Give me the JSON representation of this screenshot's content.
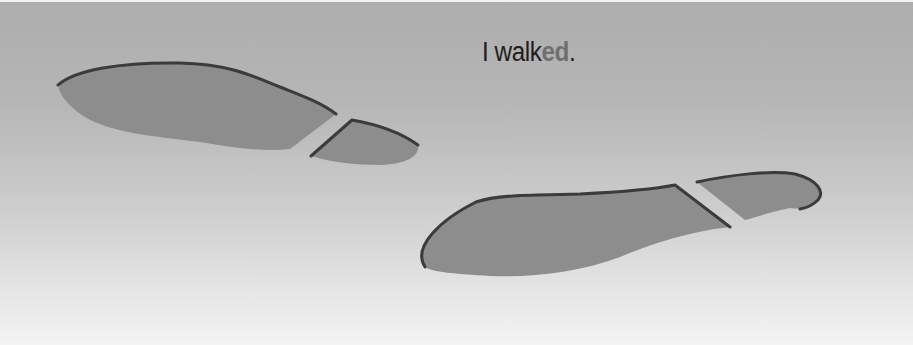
{
  "caption": {
    "base": "I walk",
    "suffix": "ed",
    "punctuation": "."
  },
  "illustration": {
    "subject": "two-footprints-walking",
    "colors": {
      "background_top": "#adadad",
      "background_bottom": "#f4f4f4",
      "sole_fill": "#8d8d8d",
      "outline": "#3b3b3b",
      "text": "#1e1e1e",
      "suffix_highlight": "#6f6f6f"
    }
  }
}
